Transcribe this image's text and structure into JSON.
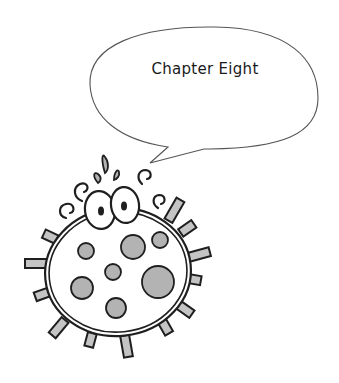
{
  "speech_bubble": {
    "text": "Chapter Eight"
  },
  "illustration": {
    "subject": "cartoon germ character with spikes and spots",
    "colors": {
      "outline": "#1f1f1f",
      "fill": "#ffffff",
      "spots": "#b3b3b3",
      "spikes": "#c4c4c4",
      "bubble_stroke": "#555555"
    }
  }
}
